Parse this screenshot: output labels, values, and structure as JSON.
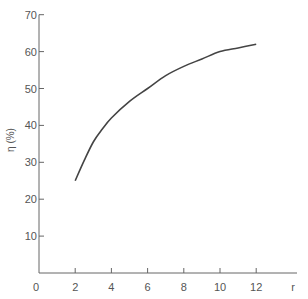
{
  "chart_data": {
    "type": "line",
    "title": "",
    "xlabel": "r",
    "ylabel": "η (%)",
    "xlim": [
      0,
      14.5
    ],
    "ylim": [
      0,
      70
    ],
    "x_ticks": [
      2,
      4,
      6,
      8,
      10,
      12
    ],
    "y_ticks": [
      10,
      20,
      30,
      40,
      50,
      60,
      70
    ],
    "origin_label": "0",
    "grid": false,
    "legend": null,
    "series": [
      {
        "name": "η",
        "x": [
          2,
          2.5,
          3,
          3.5,
          4,
          5,
          6,
          7,
          8,
          9,
          10,
          11,
          12
        ],
        "values": [
          25,
          30.5,
          35.5,
          39,
          42,
          46.5,
          50,
          53.5,
          56,
          58,
          60,
          61,
          62
        ]
      }
    ],
    "colors": {
      "axis": "#666666",
      "line": "#444444",
      "text": "#555555"
    }
  }
}
